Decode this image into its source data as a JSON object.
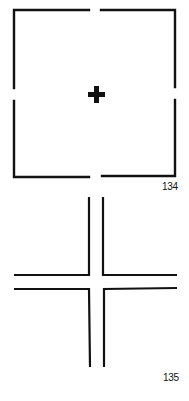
{
  "figures": [
    {
      "id": "fig-134",
      "label": "134",
      "description": "Square outline with gaps at midpoints of each side and a bold plus sign in center"
    },
    {
      "id": "fig-135",
      "label": "135",
      "description": "Two parallel vertical lines crossing two parallel horizontal lines with an open intersection"
    }
  ],
  "colors": {
    "stroke": "#111111",
    "background": "#ffffff"
  }
}
